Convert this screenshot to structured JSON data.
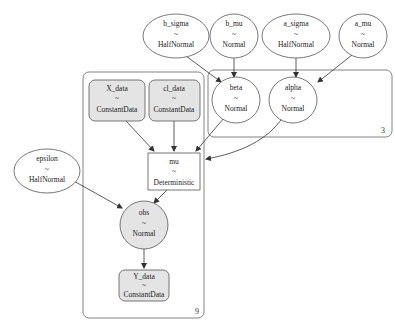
{
  "graph": {
    "nodes": [
      {
        "id": "b_sigma",
        "name": "b_sigma",
        "tilde": "~",
        "dist": "HalfNormal",
        "shape": "ellipse",
        "observed": false
      },
      {
        "id": "b_mu",
        "name": "b_mu",
        "tilde": "~",
        "dist": "Normal",
        "shape": "ellipse",
        "observed": false
      },
      {
        "id": "a_sigma",
        "name": "a_sigma",
        "tilde": "~",
        "dist": "HalfNormal",
        "shape": "ellipse",
        "observed": false
      },
      {
        "id": "a_mu",
        "name": "a_mu",
        "tilde": "~",
        "dist": "Normal",
        "shape": "ellipse",
        "observed": false
      },
      {
        "id": "beta",
        "name": "beta",
        "tilde": "~",
        "dist": "Normal",
        "shape": "ellipse",
        "observed": false
      },
      {
        "id": "alpha",
        "name": "alpha",
        "tilde": "~",
        "dist": "Normal",
        "shape": "ellipse",
        "observed": false
      },
      {
        "id": "X_data",
        "name": "X_data",
        "tilde": "~",
        "dist": "ConstantData",
        "shape": "roundbox",
        "observed": true
      },
      {
        "id": "cl_data",
        "name": "cl_data",
        "tilde": "~",
        "dist": "ConstantData",
        "shape": "roundbox",
        "observed": true
      },
      {
        "id": "mu",
        "name": "mu",
        "tilde": "~",
        "dist": "Deterministic",
        "shape": "box",
        "observed": false
      },
      {
        "id": "epsilon",
        "name": "epsilon",
        "tilde": "~",
        "dist": "HalfNormal",
        "shape": "ellipse",
        "observed": false
      },
      {
        "id": "obs",
        "name": "obs",
        "tilde": "~",
        "dist": "Normal",
        "shape": "ellipse",
        "observed": true
      },
      {
        "id": "Y_data",
        "name": "Y_data",
        "tilde": "~",
        "dist": "ConstantData",
        "shape": "roundbox",
        "observed": true
      }
    ],
    "plates": [
      {
        "id": "plate-3",
        "label": "3",
        "members": [
          "beta",
          "alpha"
        ]
      },
      {
        "id": "plate-9",
        "label": "9",
        "members": [
          "X_data",
          "cl_data",
          "mu",
          "obs",
          "Y_data"
        ]
      }
    ],
    "edges": [
      [
        "b_sigma",
        "beta"
      ],
      [
        "b_mu",
        "beta"
      ],
      [
        "a_sigma",
        "alpha"
      ],
      [
        "a_mu",
        "alpha"
      ],
      [
        "X_data",
        "mu"
      ],
      [
        "cl_data",
        "mu"
      ],
      [
        "beta",
        "mu"
      ],
      [
        "alpha",
        "mu"
      ],
      [
        "mu",
        "obs"
      ],
      [
        "epsilon",
        "obs"
      ],
      [
        "obs",
        "Y_data"
      ]
    ],
    "colors": {
      "stroke": "#555555",
      "observed_fill": "#e4e4e4",
      "background": "#ffffff"
    }
  }
}
